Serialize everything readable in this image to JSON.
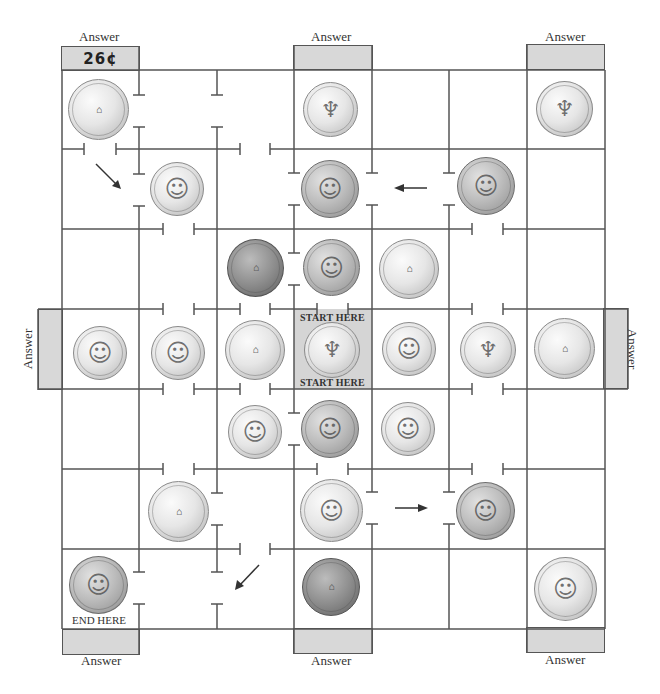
{
  "puzzle": {
    "type": "coin-maze",
    "start_label": "START HERE",
    "end_label": "END HERE",
    "answer_label": "Answer",
    "answers": [
      {
        "id": "top-left",
        "value": "26¢"
      },
      {
        "id": "top-center",
        "value": ""
      },
      {
        "id": "top-right",
        "value": ""
      },
      {
        "id": "left",
        "value": ""
      },
      {
        "id": "right",
        "value": ""
      },
      {
        "id": "bottom-left",
        "value": ""
      },
      {
        "id": "bottom-center",
        "value": ""
      },
      {
        "id": "bottom-right",
        "value": ""
      }
    ],
    "coins": [
      {
        "row": 0,
        "col": 0,
        "kind": "nickel",
        "side": "back",
        "value_cents": 5
      },
      {
        "row": 0,
        "col": 3,
        "kind": "dime",
        "side": "back",
        "value_cents": 10
      },
      {
        "row": 0,
        "col": 6,
        "kind": "dime",
        "side": "back",
        "value_cents": 10
      },
      {
        "row": 1,
        "col": 1,
        "kind": "dime",
        "side": "front",
        "value_cents": 10
      },
      {
        "row": 1,
        "col": 3,
        "kind": "penny",
        "side": "front",
        "value_cents": 1
      },
      {
        "row": 1,
        "col": 5,
        "kind": "penny",
        "side": "front",
        "value_cents": 1
      },
      {
        "row": 2,
        "col": 2,
        "kind": "penny",
        "side": "back",
        "value_cents": 1
      },
      {
        "row": 2,
        "col": 3,
        "kind": "penny",
        "side": "front",
        "value_cents": 1
      },
      {
        "row": 2,
        "col": 4,
        "kind": "nickel",
        "side": "back",
        "value_cents": 5
      },
      {
        "row": 3,
        "col": 0,
        "kind": "dime",
        "side": "front",
        "value_cents": 10
      },
      {
        "row": 3,
        "col": 1,
        "kind": "dime",
        "side": "front",
        "value_cents": 10
      },
      {
        "row": 3,
        "col": 2,
        "kind": "nickel",
        "side": "back",
        "value_cents": 5
      },
      {
        "row": 3,
        "col": 3,
        "kind": "dime",
        "side": "back",
        "value_cents": 10
      },
      {
        "row": 3,
        "col": 4,
        "kind": "dime",
        "side": "front",
        "value_cents": 10
      },
      {
        "row": 3,
        "col": 5,
        "kind": "dime",
        "side": "back",
        "value_cents": 10
      },
      {
        "row": 3,
        "col": 6,
        "kind": "nickel",
        "side": "back",
        "value_cents": 5
      },
      {
        "row": 4,
        "col": 2,
        "kind": "dime",
        "side": "front",
        "value_cents": 10
      },
      {
        "row": 4,
        "col": 3,
        "kind": "penny",
        "side": "front",
        "value_cents": 1
      },
      {
        "row": 4,
        "col": 4,
        "kind": "dime",
        "side": "front",
        "value_cents": 10
      },
      {
        "row": 5,
        "col": 1,
        "kind": "nickel",
        "side": "back",
        "value_cents": 5
      },
      {
        "row": 5,
        "col": 3,
        "kind": "nickel",
        "side": "front",
        "value_cents": 5
      },
      {
        "row": 5,
        "col": 5,
        "kind": "penny",
        "side": "front",
        "value_cents": 1
      },
      {
        "row": 6,
        "col": 0,
        "kind": "penny",
        "side": "front",
        "value_cents": 1
      },
      {
        "row": 6,
        "col": 3,
        "kind": "penny",
        "side": "back",
        "value_cents": 1
      },
      {
        "row": 6,
        "col": 6,
        "kind": "nickel",
        "side": "front",
        "value_cents": 5
      }
    ],
    "arrows": [
      {
        "id": "arrow-top-left",
        "direction": "down-right"
      },
      {
        "id": "arrow-upper-middle",
        "direction": "left"
      },
      {
        "id": "arrow-lower-middle",
        "direction": "right"
      },
      {
        "id": "arrow-bottom-left",
        "direction": "down-left"
      }
    ],
    "glyphs": {
      "portrait": "☺",
      "building": "⌂",
      "torch": "♆"
    }
  }
}
